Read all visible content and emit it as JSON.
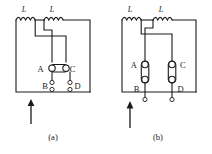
{
  "figure": {
    "type": "electrical-circuit-diagram",
    "stroke_color": "#1a1a1a",
    "background_color": "#ffffff",
    "panels": [
      {
        "id": "a",
        "caption": "(a)",
        "inductors": [
          {
            "label": "L"
          },
          {
            "label": "L"
          }
        ],
        "lamp_orientation": "horizontal",
        "lamps": [
          {
            "terminals": [
              "A",
              "C"
            ]
          }
        ],
        "terminals": [
          {
            "label": "A"
          },
          {
            "label": "C"
          },
          {
            "label": "B"
          },
          {
            "label": "D"
          }
        ],
        "supply_arrow": {
          "direction": "up"
        }
      },
      {
        "id": "b",
        "caption": "(b)",
        "inductors": [
          {
            "label": "L"
          },
          {
            "label": "L"
          }
        ],
        "lamp_orientation": "vertical",
        "lamps": [
          {
            "terminals": [
              "A",
              "B"
            ]
          },
          {
            "terminals": [
              "C",
              "D"
            ]
          }
        ],
        "terminals": [
          {
            "label": "A"
          },
          {
            "label": "B"
          },
          {
            "label": "C"
          },
          {
            "label": "D"
          }
        ],
        "supply_arrow": {
          "direction": "up"
        }
      }
    ]
  },
  "labels": {
    "a_ind_left": "L",
    "a_ind_right": "L",
    "a_A": "A",
    "a_C": "C",
    "a_B": "B",
    "a_D": "D",
    "a_caption": "(a)",
    "b_ind_left": "L",
    "b_ind_right": "L",
    "b_A": "A",
    "b_C": "C",
    "b_B": "B",
    "b_D": "D",
    "b_caption": "(b)"
  }
}
